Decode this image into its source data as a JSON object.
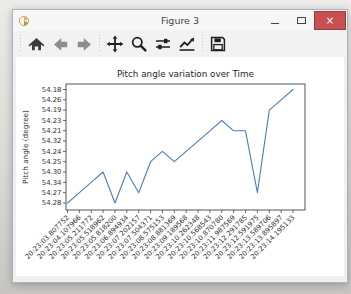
{
  "window": {
    "title": "Figure 3",
    "close_color": "#c75050",
    "controls": [
      "minimize",
      "maximize",
      "close"
    ]
  },
  "toolbar": {
    "buttons": [
      "home",
      "back",
      "forward",
      "pan",
      "zoom",
      "configure-subplots",
      "edit-axes",
      "save"
    ]
  },
  "chart_data": {
    "type": "line",
    "title": "Pitch angle variation over Time",
    "xlabel": "",
    "ylabel": "Pitch angle (degree)",
    "legend_position": "none",
    "grid": false,
    "x_tick_rotation": 45,
    "line_color": "#4a7ebb",
    "categories": [
      "20:23:03.807752",
      "20:23:04.107966",
      "20:23:05.211772",
      "20:23:05.518962",
      "20:23:05.818200",
      "20:23:06.894934",
      "20:23:07.202157",
      "20:23:07.504371",
      "20:23:08.575153",
      "20:23:08.881369",
      "20:23:09.189568",
      "20:23:10.262348",
      "20:23:10.568543",
      "20:23:10.870780",
      "20:23:11.987569",
      "20:23:12.291785",
      "20:23:12.591975",
      "20:23:13.589706",
      "20:23:13.895897",
      "20:23:14.195133"
    ],
    "values": [
      "54.28",
      "54.27",
      "54.34",
      "54.30",
      "54.28",
      "54.30",
      "54.27",
      "54.25",
      "54.24",
      "54.25",
      "54.24",
      "54.32",
      "54.21",
      "54.23",
      "54.21",
      "54.21",
      "54.27",
      "54.19",
      "54.26",
      "54.18"
    ],
    "y_categories_bottom_to_top": [
      "54.28",
      "54.27",
      "54.34",
      "54.30",
      "54.25",
      "54.24",
      "54.32",
      "54.21",
      "54.23",
      "54.19",
      "54.26",
      "54.18"
    ]
  }
}
